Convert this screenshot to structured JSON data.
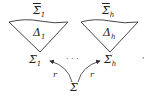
{
  "diagram": {
    "left": {
      "top_label": "Σ̄",
      "top_sub": "1",
      "inner_label": "Δ",
      "inner_sub": "1",
      "bottom_label": "Σ",
      "bottom_sub": "1"
    },
    "right": {
      "top_label": "Σ̄",
      "top_sub": "h",
      "inner_label": "Δ",
      "inner_sub": "h",
      "bottom_label": "Σ",
      "bottom_sub": "h"
    },
    "dots": "· · ·",
    "source": "Σ",
    "arrow_left_label": "r",
    "arrow_right_label": "r",
    "trailing_punct": ","
  }
}
